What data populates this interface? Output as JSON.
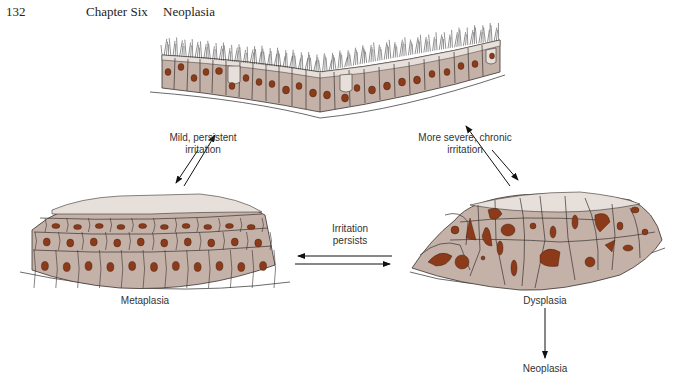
{
  "header": {
    "page_number": "132",
    "chapter": "Chapter Six",
    "section": "Neoplasia"
  },
  "figure": {
    "stages": {
      "normal": {
        "label": ""
      },
      "metaplasia": {
        "label": "Metaplasia"
      },
      "dysplasia": {
        "label": "Dysplasia"
      },
      "neoplasia": {
        "label": "Neoplasia"
      }
    },
    "transitions": {
      "normal_metaplasia": {
        "label_line1": "Mild, persistent",
        "label_line2": "irritation"
      },
      "normal_dysplasia": {
        "label_line1": "More severe, chronic",
        "label_line2": "irritation"
      },
      "metaplasia_dysplasia": {
        "label_line1": "Irritation",
        "label_line2": "persists"
      }
    },
    "colors": {
      "cytoplasm": "#c4b2a8",
      "cytoplasm_light": "#e6dfda",
      "nucleus": "#8b3a1a",
      "outline": "#3a3230",
      "arrow": "#111111"
    }
  },
  "footer": {
    "cutoff_text": "— — — — — — — — — — — — — — — — — — — — — — — — — — — — — — —"
  }
}
